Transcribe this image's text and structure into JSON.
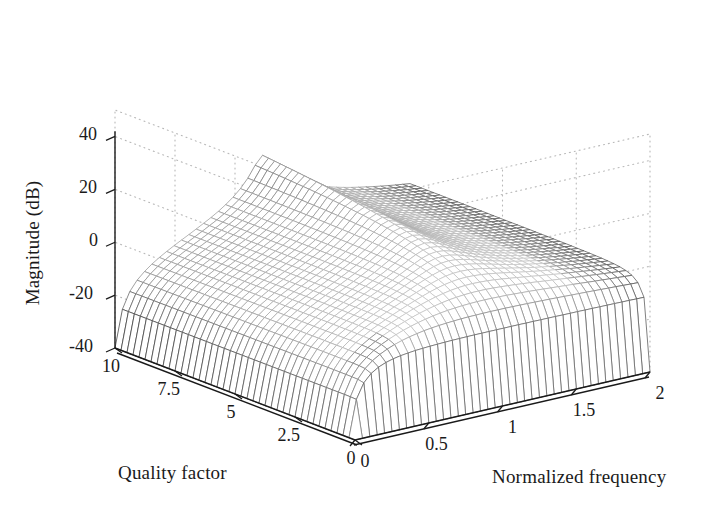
{
  "figure": {
    "background": "#ffffff",
    "ink": "#1a1a1a",
    "mesh_color_dark": "#4a4a4a",
    "mesh_color_light": "#d8d8d8",
    "grid_color": "#b8b8b8"
  },
  "axes": {
    "z": {
      "label": "Magnitude (dB)",
      "ticks": [
        "40",
        "20",
        "0",
        "-20",
        "-40"
      ],
      "tick_values": [
        40,
        20,
        0,
        -20,
        -40
      ],
      "range": [
        -40,
        50
      ]
    },
    "x": {
      "label": "Quality factor",
      "ticks": [
        "10",
        "7.5",
        "5",
        "2.5",
        "0"
      ],
      "tick_values": [
        10,
        7.5,
        5,
        2.5,
        0
      ],
      "range": [
        0,
        10
      ]
    },
    "y": {
      "label": "Normalized frequency",
      "ticks": [
        "0",
        "0.5",
        "1",
        "1.5",
        "2"
      ],
      "tick_values": [
        0,
        0.5,
        1,
        1.5,
        2
      ],
      "range": [
        0,
        2
      ]
    }
  },
  "chart_data": {
    "type": "surface",
    "title": "",
    "xlabel": "Quality factor",
    "ylabel": "Normalized frequency",
    "zlabel": "Magnitude (dB)",
    "xlim": [
      0,
      10
    ],
    "ylim": [
      0,
      2
    ],
    "zlim": [
      -40,
      50
    ],
    "grid": true,
    "legend": "none",
    "render": "wireframe-mesh",
    "mesh_divisions_x": 40,
    "mesh_divisions_y": 40,
    "surface_formula": "20*log10( (w/Q) / sqrt( (1-w^2)^2 + (w/Q)^2 ) ) normalized so peak = 20*log10(Q)",
    "key_points": [
      {
        "quality_factor": 10,
        "normalized_frequency": 1.0,
        "magnitude_db": 46
      },
      {
        "quality_factor": 10,
        "normalized_frequency": 0.0,
        "magnitude_db": -6
      },
      {
        "quality_factor": 10,
        "normalized_frequency": 2.0,
        "magnitude_db": -22
      },
      {
        "quality_factor": 5,
        "normalized_frequency": 1.0,
        "magnitude_db": 34
      },
      {
        "quality_factor": 2.5,
        "normalized_frequency": 1.0,
        "magnitude_db": 22
      },
      {
        "quality_factor": 0.5,
        "normalized_frequency": 1.0,
        "magnitude_db": 2
      },
      {
        "quality_factor": 0.0,
        "normalized_frequency": 0.0,
        "magnitude_db": -40
      },
      {
        "quality_factor": 0.0,
        "normalized_frequency": 2.0,
        "magnitude_db": -30
      }
    ],
    "x_samples": [
      0,
      0.5,
      1,
      1.5,
      2,
      2.5,
      3,
      3.5,
      4,
      4.5,
      5,
      5.5,
      6,
      6.5,
      7,
      7.5,
      8,
      8.5,
      9,
      9.5,
      10
    ],
    "y_samples": [
      0,
      0.1,
      0.2,
      0.3,
      0.4,
      0.5,
      0.6,
      0.7,
      0.8,
      0.9,
      1.0,
      1.1,
      1.2,
      1.3,
      1.4,
      1.5,
      1.6,
      1.7,
      1.8,
      1.9,
      2.0
    ]
  },
  "view": {
    "azimuth_deg": -37.5,
    "elevation_deg": 30
  }
}
